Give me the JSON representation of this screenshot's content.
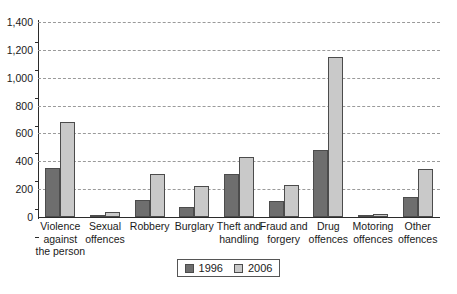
{
  "chart_data": {
    "type": "bar",
    "title": "",
    "subtitle": "",
    "xlabel": "",
    "ylabel": "",
    "ylim": [
      0,
      1400
    ],
    "ytick_labels": [
      "0",
      "200",
      "400",
      "600",
      "800",
      "1,000",
      "1,200",
      "1,400"
    ],
    "ytick_values": [
      0,
      200,
      400,
      600,
      800,
      1000,
      1200,
      1400
    ],
    "grid": "horizontal-dashed",
    "legend_position": "bottom-center",
    "categories": [
      "Violence\nagainst\nthe person",
      "Sexual\noffences",
      "Robbery",
      "Burglary",
      "Theft and\nhandling",
      "Fraud and\nforgery",
      "Drug\noffences",
      "Motoring\noffences",
      "Other\noffences"
    ],
    "series": [
      {
        "name": "1996",
        "color": "#6e6e6e",
        "values": [
          350,
          12,
          125,
          75,
          310,
          115,
          480,
          10,
          145
        ]
      },
      {
        "name": "2006",
        "color": "#c9c9c9",
        "values": [
          680,
          35,
          310,
          225,
          430,
          230,
          1150,
          25,
          345
        ]
      }
    ]
  },
  "legend": {
    "items": [
      {
        "label": "1996",
        "swatch": "legend-swatch-1996"
      },
      {
        "label": "2006",
        "swatch": "legend-swatch-2006"
      }
    ]
  },
  "colors": {
    "series_1996": "#6e6e6e",
    "series_2006": "#c9c9c9",
    "bar_border": "#4c4c4c",
    "axis": "#2b2b2b",
    "gridline": "#9a9a9a",
    "text": "#1a1a1a",
    "background": "#ffffff"
  }
}
